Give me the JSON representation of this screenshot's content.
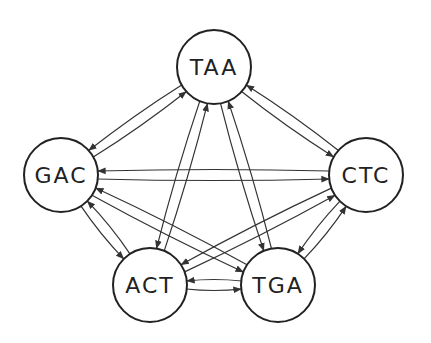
{
  "diagram": {
    "type": "directed-graph",
    "colors": {
      "stroke": "#222222",
      "background": "#ffffff"
    },
    "node_radius": 37,
    "nodes": [
      {
        "id": "TAA",
        "label": "TAA",
        "x": 214,
        "y": 67
      },
      {
        "id": "GAC",
        "label": "GAC",
        "x": 61,
        "y": 175
      },
      {
        "id": "CTC",
        "label": "CTC",
        "x": 366,
        "y": 175
      },
      {
        "id": "ACT",
        "label": "ACT",
        "x": 150,
        "y": 285
      },
      {
        "id": "TGA",
        "label": "TGA",
        "x": 278,
        "y": 285
      }
    ],
    "edges": [
      {
        "from": "GAC",
        "to": "TAA"
      },
      {
        "from": "TAA",
        "to": "GAC"
      },
      {
        "from": "TAA",
        "to": "CTC"
      },
      {
        "from": "CTC",
        "to": "TAA"
      },
      {
        "from": "GAC",
        "to": "CTC"
      },
      {
        "from": "CTC",
        "to": "GAC"
      },
      {
        "from": "ACT",
        "to": "TAA"
      },
      {
        "from": "TAA",
        "to": "ACT"
      },
      {
        "from": "TGA",
        "to": "TAA"
      },
      {
        "from": "TAA",
        "to": "TGA"
      },
      {
        "from": "GAC",
        "to": "ACT"
      },
      {
        "from": "ACT",
        "to": "GAC"
      },
      {
        "from": "GAC",
        "to": "TGA"
      },
      {
        "from": "TGA",
        "to": "GAC"
      },
      {
        "from": "CTC",
        "to": "ACT"
      },
      {
        "from": "ACT",
        "to": "CTC"
      },
      {
        "from": "CTC",
        "to": "TGA"
      },
      {
        "from": "TGA",
        "to": "CTC"
      },
      {
        "from": "ACT",
        "to": "TGA"
      },
      {
        "from": "TGA",
        "to": "ACT"
      }
    ]
  }
}
